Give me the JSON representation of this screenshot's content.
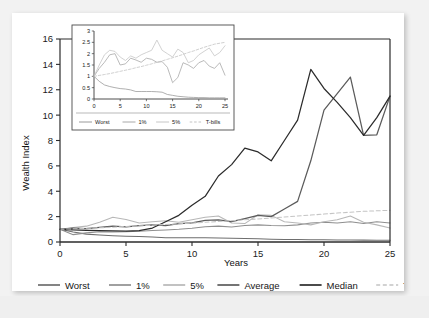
{
  "chart_data": {
    "type": "line",
    "title": "",
    "xlabel": "Years",
    "ylabel": "Wealth Index",
    "xlim": [
      0,
      25
    ],
    "ylim": [
      0,
      16
    ],
    "xticks": [
      0,
      5,
      10,
      15,
      20,
      25
    ],
    "yticks": [
      0,
      2,
      4,
      6,
      8,
      10,
      12,
      14,
      16
    ],
    "grid": false,
    "legend_position": "bottom",
    "x": [
      0,
      1,
      2,
      3,
      4,
      5,
      6,
      7,
      8,
      9,
      10,
      11,
      12,
      13,
      14,
      15,
      16,
      17,
      18,
      19,
      20,
      21,
      22,
      23,
      24,
      25
    ],
    "series": [
      {
        "name": "Worst",
        "color": "#6e6e6e",
        "dash": "solid",
        "values": [
          1.0,
          0.78,
          0.62,
          0.55,
          0.5,
          0.46,
          0.44,
          0.4,
          0.33,
          0.33,
          0.33,
          0.33,
          0.32,
          0.3,
          0.28,
          0.26,
          0.22,
          0.2,
          0.19,
          0.18,
          0.17,
          0.16,
          0.15,
          0.15,
          0.14,
          0.14
        ]
      },
      {
        "name": "1%",
        "color": "#8f8f8f",
        "dash": "solid",
        "values": [
          1.0,
          0.58,
          0.72,
          0.8,
          0.78,
          0.8,
          0.85,
          0.9,
          0.95,
          1.0,
          1.08,
          1.2,
          1.25,
          1.18,
          1.3,
          1.35,
          1.3,
          1.28,
          1.35,
          1.5,
          1.55,
          1.5,
          1.6,
          1.45,
          1.6,
          1.5
        ]
      },
      {
        "name": "5%",
        "color": "#b7b7b7",
        "dash": "solid",
        "values": [
          1.0,
          1.15,
          1.25,
          1.55,
          1.95,
          1.78,
          1.5,
          1.6,
          1.68,
          1.55,
          1.75,
          1.95,
          2.05,
          1.5,
          1.45,
          2.15,
          2.1,
          1.6,
          1.5,
          1.35,
          1.6,
          1.75,
          2.05,
          1.55,
          1.35,
          1.1
        ]
      },
      {
        "name": "Average",
        "color": "#5b5b5b",
        "dash": "solid",
        "values": [
          1.0,
          1.1,
          1.05,
          1.15,
          1.25,
          1.2,
          1.3,
          1.35,
          1.3,
          1.45,
          1.5,
          1.7,
          1.75,
          1.6,
          1.85,
          2.1,
          2.0,
          2.6,
          3.2,
          6.4,
          10.4,
          11.7,
          13.0,
          8.4,
          8.45,
          11.5
        ]
      },
      {
        "name": "Median",
        "color": "#2b2b2b",
        "dash": "solid",
        "values": [
          1.0,
          0.95,
          0.92,
          0.9,
          0.88,
          0.85,
          0.9,
          1.1,
          1.6,
          2.1,
          2.9,
          3.6,
          5.2,
          6.1,
          7.4,
          7.1,
          6.4,
          8.0,
          9.6,
          13.6,
          12.1,
          11.0,
          9.8,
          8.4,
          9.8,
          11.5
        ]
      },
      {
        "name": "T-bills",
        "color": "#c4c4c4",
        "dash": "dashed",
        "values": [
          1.0,
          1.04,
          1.08,
          1.12,
          1.17,
          1.22,
          1.27,
          1.32,
          1.38,
          1.43,
          1.49,
          1.55,
          1.62,
          1.68,
          1.75,
          1.82,
          1.89,
          1.97,
          2.05,
          2.12,
          2.2,
          2.28,
          2.35,
          2.42,
          2.46,
          2.5
        ]
      }
    ],
    "legend": [
      {
        "label": "Worst",
        "color": "#6e6e6e",
        "dash": "solid"
      },
      {
        "label": "1%",
        "color": "#8f8f8f",
        "dash": "solid"
      },
      {
        "label": "5%",
        "color": "#b7b7b7",
        "dash": "solid"
      },
      {
        "label": "Average",
        "color": "#5b5b5b",
        "dash": "solid"
      },
      {
        "label": "Median",
        "color": "#2b2b2b",
        "dash": "solid"
      },
      {
        "label": "T-bills",
        "color": "#c4c4c4",
        "dash": "dashed"
      }
    ],
    "inset": {
      "type": "line",
      "xlabel": "",
      "ylabel": "",
      "xlim": [
        0,
        25
      ],
      "ylim": [
        0,
        3
      ],
      "xticks": [
        0,
        5,
        10,
        15,
        20,
        25
      ],
      "yticks": [
        0,
        0.5,
        1,
        1.5,
        2,
        2.5,
        3
      ],
      "ytick_labels": [
        "0",
        "0.5",
        "1",
        "1.5",
        "2",
        "2.5",
        "3"
      ],
      "grid": false,
      "legend_position": "bottom",
      "x": [
        0,
        1,
        2,
        3,
        4,
        5,
        6,
        7,
        8,
        9,
        10,
        11,
        12,
        13,
        14,
        15,
        16,
        17,
        18,
        19,
        20,
        21,
        22,
        23,
        24,
        25
      ],
      "series": [
        {
          "name": "Worst",
          "color": "#9a9a9a",
          "dash": "solid",
          "values": [
            1.0,
            0.78,
            0.62,
            0.55,
            0.5,
            0.46,
            0.44,
            0.4,
            0.33,
            0.33,
            0.33,
            0.33,
            0.32,
            0.3,
            0.2,
            0.16,
            0.12,
            0.1,
            0.08,
            0.07,
            0.06,
            0.06,
            0.05,
            0.05,
            0.05,
            0.05
          ]
        },
        {
          "name": "1%",
          "color": "#a8a8a8",
          "dash": "solid",
          "values": [
            1.0,
            1.35,
            1.62,
            1.95,
            2.0,
            1.5,
            1.55,
            1.8,
            1.72,
            1.62,
            1.8,
            1.75,
            1.62,
            1.65,
            1.4,
            0.72,
            0.95,
            1.6,
            1.5,
            1.35,
            1.6,
            1.7,
            1.45,
            1.35,
            1.6,
            1.05
          ]
        },
        {
          "name": "5%",
          "color": "#c6c6c6",
          "dash": "solid",
          "values": [
            1.0,
            1.5,
            1.95,
            2.15,
            2.1,
            1.85,
            1.7,
            1.9,
            1.8,
            1.95,
            2.05,
            2.15,
            2.6,
            2.15,
            2.0,
            1.85,
            2.2,
            2.05,
            1.6,
            1.7,
            1.95,
            2.1,
            2.25,
            1.9,
            2.05,
            2.35
          ]
        },
        {
          "name": "T-bills",
          "color": "#c4c4c4",
          "dash": "dashed",
          "values": [
            1.0,
            1.04,
            1.08,
            1.12,
            1.17,
            1.22,
            1.27,
            1.32,
            1.38,
            1.43,
            1.49,
            1.55,
            1.62,
            1.68,
            1.75,
            1.82,
            1.89,
            1.97,
            2.05,
            2.12,
            2.2,
            2.28,
            2.35,
            2.42,
            2.46,
            2.5
          ]
        }
      ],
      "legend": [
        {
          "label": "Worst",
          "color": "#9a9a9a",
          "dash": "solid"
        },
        {
          "label": "1%",
          "color": "#a8a8a8",
          "dash": "solid"
        },
        {
          "label": "5%",
          "color": "#c6c6c6",
          "dash": "solid"
        },
        {
          "label": "T-bills",
          "color": "#c4c4c4",
          "dash": "dashed"
        }
      ]
    }
  }
}
